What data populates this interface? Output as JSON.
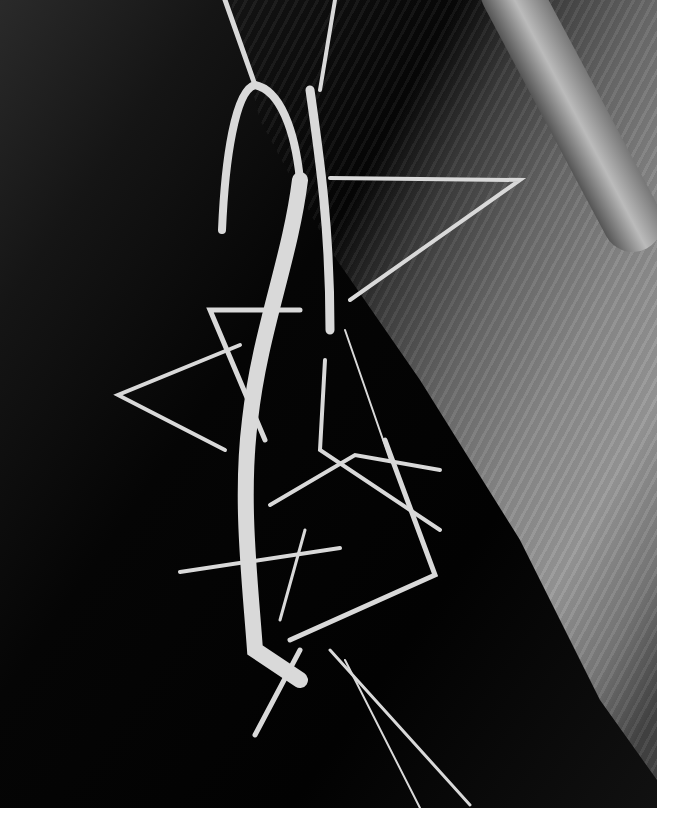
{
  "image": {
    "subject": "two stick insects on a leaf",
    "style": "black and white photograph",
    "colors": {
      "background": "#050505",
      "leaf": "#8a8a8a",
      "insect": "#d8d8d8",
      "border": "#ffffff"
    }
  }
}
